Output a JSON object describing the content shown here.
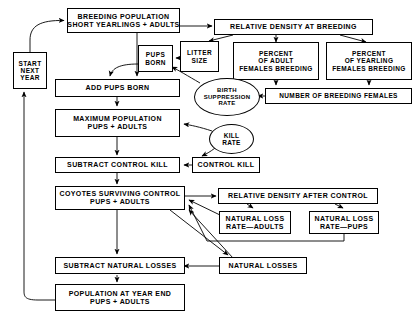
{
  "diagram": {
    "stroke_color": "#000000",
    "background_color": "#ffffff",
    "nodes": [
      {
        "id": "start_next_year",
        "shape": "box",
        "lines": [
          "START",
          "NEXT",
          "YEAR"
        ]
      },
      {
        "id": "breeding_population",
        "shape": "box",
        "lines": [
          "BREEDING POPULATION",
          "SHORT YEARLINGS + ADULTS"
        ]
      },
      {
        "id": "relative_density_breeding",
        "shape": "box",
        "lines": [
          "RELATIVE DENSITY AT BREEDING"
        ]
      },
      {
        "id": "pups_born",
        "shape": "box",
        "lines": [
          "PUPS",
          "BORN"
        ]
      },
      {
        "id": "litter_size",
        "shape": "box",
        "lines": [
          "LITTER",
          "SIZE"
        ]
      },
      {
        "id": "percent_adult_females",
        "shape": "box",
        "lines": [
          "PERCENT",
          "OF ADULT",
          "FEMALES BREEDING"
        ]
      },
      {
        "id": "percent_yearling_females",
        "shape": "box",
        "lines": [
          "PERCENT",
          "OF YEARLING",
          "FEMALES BREEDING"
        ]
      },
      {
        "id": "add_pups_born",
        "shape": "box",
        "lines": [
          "ADD PUPS BORN"
        ]
      },
      {
        "id": "birth_suppression_rate",
        "shape": "ellipse",
        "lines": [
          "BIRTH",
          "SUPPRESSION",
          "RATE"
        ]
      },
      {
        "id": "number_breeding_females",
        "shape": "box",
        "lines": [
          "NUMBER OF BREEDING FEMALES"
        ]
      },
      {
        "id": "maximum_population",
        "shape": "box",
        "lines": [
          "MAXIMUM POPULATION",
          "PUPS + ADULTS"
        ]
      },
      {
        "id": "kill_rate",
        "shape": "ellipse",
        "lines": [
          "KILL",
          "RATE"
        ]
      },
      {
        "id": "subtract_control_kill",
        "shape": "box",
        "lines": [
          "SUBTRACT CONTROL KILL"
        ]
      },
      {
        "id": "control_kill",
        "shape": "box",
        "lines": [
          "CONTROL KILL"
        ]
      },
      {
        "id": "coyotes_surviving_control",
        "shape": "box",
        "lines": [
          "COYOTES SURVIVING CONTROL",
          "PUPS + ADULTS"
        ]
      },
      {
        "id": "relative_density_after_control",
        "shape": "box",
        "lines": [
          "RELATIVE DENSITY AFTER CONTROL"
        ]
      },
      {
        "id": "natural_loss_rate_adults",
        "shape": "box",
        "lines": [
          "NATURAL LOSS",
          "RATE—ADULTS"
        ]
      },
      {
        "id": "natural_loss_rate_pups",
        "shape": "box",
        "lines": [
          "NATURAL LOSS",
          "RATE—PUPS"
        ]
      },
      {
        "id": "subtract_natural_losses",
        "shape": "box",
        "lines": [
          "SUBTRACT NATURAL LOSSES"
        ]
      },
      {
        "id": "natural_losses",
        "shape": "box",
        "lines": [
          "NATURAL  LOSSES"
        ]
      },
      {
        "id": "population_year_end",
        "shape": "box",
        "lines": [
          "POPULATION AT YEAR END",
          "PUPS + ADULTS"
        ]
      }
    ],
    "edges": [
      {
        "from": "start_next_year",
        "to": "breeding_population"
      },
      {
        "from": "breeding_population",
        "to": "relative_density_breeding"
      },
      {
        "from": "breeding_population",
        "to": "add_pups_born"
      },
      {
        "from": "relative_density_breeding",
        "to": "litter_size"
      },
      {
        "from": "relative_density_breeding",
        "to": "percent_adult_females"
      },
      {
        "from": "relative_density_breeding",
        "to": "percent_yearling_females"
      },
      {
        "from": "litter_size",
        "to": "pups_born"
      },
      {
        "from": "pups_born",
        "to": "add_pups_born"
      },
      {
        "from": "percent_adult_females",
        "to": "number_breeding_females"
      },
      {
        "from": "percent_yearling_females",
        "to": "number_breeding_females"
      },
      {
        "from": "number_breeding_females",
        "to": "birth_suppression_rate"
      },
      {
        "from": "birth_suppression_rate",
        "to": "pups_born"
      },
      {
        "from": "add_pups_born",
        "to": "maximum_population"
      },
      {
        "from": "kill_rate",
        "to": "maximum_population"
      },
      {
        "from": "kill_rate",
        "to": "control_kill"
      },
      {
        "from": "maximum_population",
        "to": "subtract_control_kill"
      },
      {
        "from": "control_kill",
        "to": "subtract_control_kill"
      },
      {
        "from": "subtract_control_kill",
        "to": "coyotes_surviving_control"
      },
      {
        "from": "coyotes_surviving_control",
        "to": "relative_density_after_control"
      },
      {
        "from": "relative_density_after_control",
        "to": "natural_loss_rate_adults"
      },
      {
        "from": "relative_density_after_control",
        "to": "natural_loss_rate_pups"
      },
      {
        "from": "natural_loss_rate_adults",
        "to": "coyotes_surviving_control"
      },
      {
        "from": "natural_loss_rate_pups",
        "to": "coyotes_surviving_control"
      },
      {
        "from": "natural_losses",
        "to": "coyotes_surviving_control"
      },
      {
        "from": "coyotes_surviving_control",
        "to": "subtract_natural_losses"
      },
      {
        "from": "coyotes_surviving_control",
        "to": "natural_losses"
      },
      {
        "from": "natural_losses",
        "to": "subtract_natural_losses"
      },
      {
        "from": "subtract_natural_losses",
        "to": "population_year_end"
      },
      {
        "from": "population_year_end",
        "to": "start_next_year"
      }
    ]
  }
}
